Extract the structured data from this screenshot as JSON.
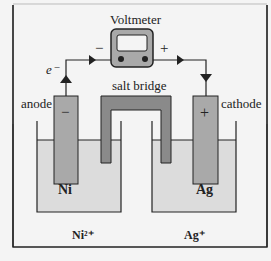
{
  "title": "Voltmeter",
  "labels": {
    "electron": "e⁻",
    "minus": "−",
    "plus": "+",
    "salt_bridge": "salt bridge",
    "anode": "anode",
    "cathode": "cathode",
    "anode_sign": "−",
    "cathode_sign": "+",
    "anode_metal": "Ni",
    "cathode_metal": "Ag",
    "anode_ion": "Ni²⁺",
    "cathode_ion": "Ag⁺"
  },
  "colors": {
    "electrode": "#a9a9a9",
    "solution": "#dcdcdc",
    "bridge": "#8a8a8a",
    "line": "#222222"
  }
}
